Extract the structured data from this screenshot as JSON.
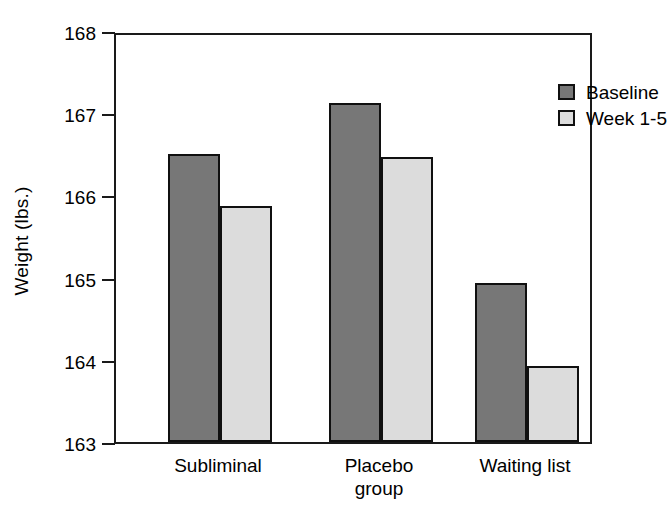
{
  "chart_data": {
    "type": "bar",
    "title": "",
    "xlabel": "",
    "ylabel": "Weight (lbs.)",
    "ylim": [
      163,
      168
    ],
    "yticks": [
      163,
      164,
      165,
      166,
      167,
      168
    ],
    "ytick_labels": [
      "163",
      "164",
      "165",
      "166",
      "167",
      "168"
    ],
    "grid": false,
    "legend_position": "top-right",
    "categories": [
      "Subliminal",
      "Placebo\ngroup",
      "Waiting list"
    ],
    "series": [
      {
        "name": "Baseline",
        "color": "#777777",
        "values": [
          166.5,
          167.13,
          164.93
        ]
      },
      {
        "name": "Week 1-5",
        "color": "#dcdcdc",
        "values": [
          165.87,
          166.47,
          163.93
        ]
      }
    ]
  },
  "axes": {
    "y_title": "Weight (lbs.)",
    "y_tick_labels": [
      "168",
      "167",
      "166",
      "165",
      "164",
      "163"
    ],
    "x_tick_labels": [
      "Subliminal",
      "Placebo\ngroup",
      "Waiting list"
    ]
  },
  "legend": {
    "entries": [
      {
        "label": "Baseline",
        "swatch": "dark-gray-swatch"
      },
      {
        "label": "Week 1-5",
        "swatch": "light-gray-swatch"
      }
    ]
  },
  "colors": {
    "baseline_fill": "#777777",
    "followup_fill": "#dcdcdc",
    "axis": "#1a1a1a",
    "background": "#ffffff"
  }
}
